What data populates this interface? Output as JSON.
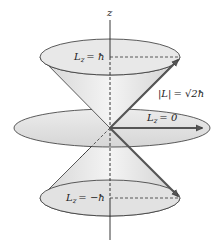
{
  "diagram": {
    "title": "",
    "axis_label": "z",
    "labels": {
      "lz_plus": {
        "sym": "L",
        "sub": "z",
        "eq": "= ħ"
      },
      "lz_zero": {
        "sym": "L",
        "sub": "z",
        "eq": "= 0"
      },
      "lz_minus": {
        "sym": "L",
        "sub": "z",
        "eq": "= −ħ"
      },
      "magnitude": {
        "text": "|L|",
        "eq": "= √2ħ"
      }
    },
    "colors": {
      "cone_fill": "#e6e6e6",
      "cone_shade": "#c8c8c8",
      "stroke": "#333333",
      "arrow": "#555555",
      "background": "#ffffff"
    }
  }
}
